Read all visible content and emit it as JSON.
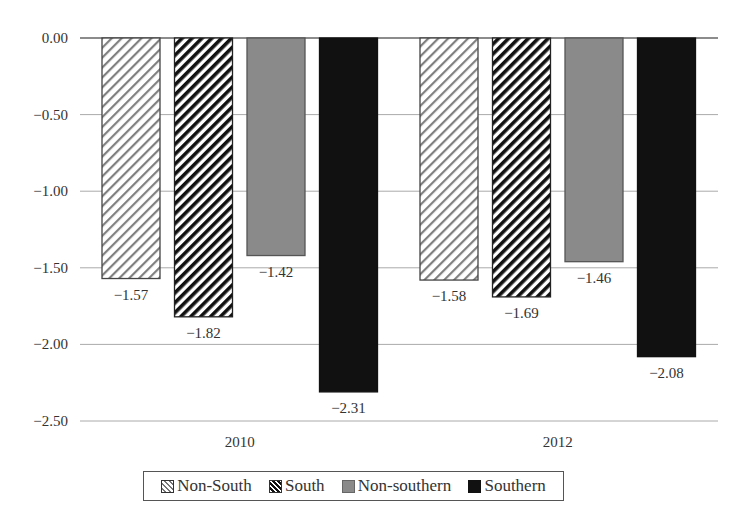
{
  "chart_data": {
    "type": "bar",
    "title": "",
    "xlabel": "",
    "ylabel": "",
    "categories": [
      "2010",
      "2012"
    ],
    "series": [
      {
        "name": "Non-South",
        "values": [
          -1.57,
          -1.58
        ],
        "fill": "hatch-light",
        "color": "#777777"
      },
      {
        "name": "South",
        "values": [
          -1.82,
          -1.69
        ],
        "fill": "hatch-dark",
        "color": "#111111"
      },
      {
        "name": "Non-southern",
        "values": [
          -1.42,
          -1.46
        ],
        "fill": "solid",
        "color": "#8a8a8a"
      },
      {
        "name": "Southern",
        "values": [
          -2.31,
          -2.08
        ],
        "fill": "solid",
        "color": "#111111"
      }
    ],
    "ylim": [
      -2.5,
      0.0
    ],
    "yticks": [
      0.0,
      -0.5,
      -1.0,
      -1.5,
      -2.0,
      -2.5
    ],
    "ytick_labels": [
      "0.00",
      "−0.50",
      "−1.00",
      "−1.50",
      "−2.00",
      "−2.50"
    ],
    "data_labels": {
      "2010": [
        "−1.57",
        "−1.82",
        "−1.42",
        "−2.31"
      ],
      "2012": [
        "−1.58",
        "−1.69",
        "−1.46",
        "−2.08"
      ]
    },
    "grid": "horizontal",
    "legend_position": "bottom"
  },
  "legend": {
    "items": [
      {
        "label": "Non-South",
        "swatch": "hatch-light"
      },
      {
        "label": "South",
        "swatch": "hatch-dark"
      },
      {
        "label": "Non-southern",
        "swatch": "solid-gray"
      },
      {
        "label": "Southern",
        "swatch": "solid-black"
      }
    ]
  }
}
